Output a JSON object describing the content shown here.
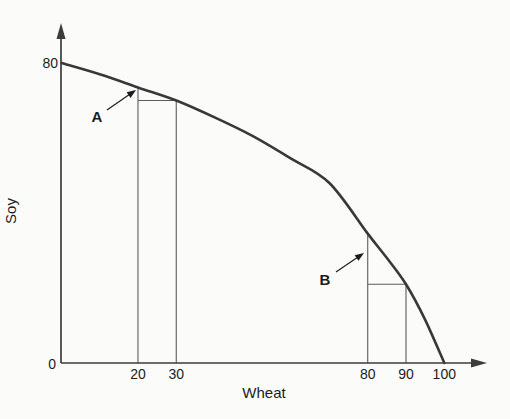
{
  "figure": {
    "width": 510,
    "height": 419,
    "background": "#fbfbfa",
    "axis_color": "#3c3c3c",
    "curve_color": "#383838",
    "guide_color": "#5c5c5c",
    "text_color": "#1c1c1c"
  },
  "chart_data": {
    "type": "line",
    "title": "",
    "xlabel": "Wheat",
    "ylabel": "Soy",
    "xlim": [
      0,
      100
    ],
    "ylim": [
      0,
      80
    ],
    "grid": false,
    "legend": "none",
    "origin_label": "0",
    "y_max_label": "80",
    "x_ticks": [
      20,
      30,
      80,
      90,
      100
    ],
    "curve": {
      "name": "production-possibilities-frontier",
      "x": [
        0,
        10,
        20,
        30,
        40,
        50,
        60,
        70,
        80,
        85,
        90,
        95,
        100
      ],
      "y": [
        80,
        77,
        73.5,
        70,
        65.5,
        60.5,
        54.5,
        48,
        34.5,
        28,
        21,
        11.5,
        0
      ]
    },
    "guides": [
      {
        "name": "A-left-vertical",
        "x1": 20,
        "y1": 0,
        "x2": 20,
        "y2": 73.5
      },
      {
        "name": "A-right-vertical",
        "x1": 30,
        "y1": 0,
        "x2": 30,
        "y2": 70
      },
      {
        "name": "A-top-horizontal",
        "x1": 20,
        "y1": 70,
        "x2": 30.5,
        "y2": 70
      },
      {
        "name": "B-left-vertical",
        "x1": 80,
        "y1": 0,
        "x2": 80,
        "y2": 34.5
      },
      {
        "name": "B-right-vertical",
        "x1": 90,
        "y1": 0,
        "x2": 90,
        "y2": 21
      },
      {
        "name": "B-top-horizontal",
        "x1": 80,
        "y1": 21,
        "x2": 90,
        "y2": 21
      }
    ],
    "annotations": [
      {
        "label": "A",
        "label_px": [
          97,
          117
        ],
        "arrow_from_px": [
          107,
          110
        ],
        "arrow_to_px": [
          136,
          90
        ]
      },
      {
        "label": "B",
        "label_px": [
          325,
          280
        ],
        "arrow_from_px": [
          336,
          272
        ],
        "arrow_to_px": [
          364,
          253
        ]
      }
    ]
  }
}
